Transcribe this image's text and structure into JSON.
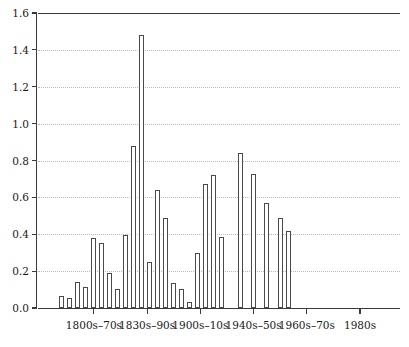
{
  "chart_data": {
    "type": "bar",
    "title": "",
    "subtitle": "",
    "xlabel": "",
    "ylabel": "",
    "ylim": [
      0.0,
      1.6
    ],
    "grid": true,
    "legend": null,
    "y_ticks": [
      0.0,
      0.2,
      0.4,
      0.6,
      0.8,
      1.0,
      1.2,
      1.4,
      1.6
    ],
    "y_tick_labels": [
      "0.0",
      "0.2",
      "0.4",
      "0.6",
      "0.8",
      "1.0",
      "1.2",
      "1.4",
      "1.6"
    ],
    "x_tick_labels": [
      "1800s–70s",
      "1830s–90s",
      "1900s–10s",
      "1940s–50s",
      "1960s–70s",
      "1980s"
    ],
    "x_tick_positions": [
      10.5,
      20.5,
      30.5,
      40.5,
      50.5,
      60.5
    ],
    "bar_count": 34,
    "bar_positions": [
      4.0,
      5.5,
      7.0,
      8.5,
      10.0,
      11.5,
      13.0,
      14.5,
      16.0,
      17.5,
      19.0,
      20.5,
      22.0,
      23.5,
      25.0,
      26.5,
      28.0,
      29.5,
      31.0,
      32.5,
      34.0,
      37.5,
      40.0,
      42.5,
      45.0,
      46.5,
      48.0,
      49.5,
      51.0,
      52.5,
      54.0,
      55.5,
      57.0,
      58.5
    ],
    "values": [
      0.065,
      0.055,
      0.14,
      0.115,
      0.38,
      0.35,
      0.19,
      0.105,
      0.395,
      0.88,
      1.48,
      0.25,
      0.64,
      0.49,
      0.135,
      0.105,
      0.03,
      0.3,
      0.67,
      0.72,
      0.385,
      0.84,
      0.725,
      0.57,
      0.49,
      0.42,
      0.0,
      0.0,
      0.0,
      0.0,
      0.0,
      0.0,
      0.0,
      0.0
    ],
    "bars": [
      {
        "value": 0.065,
        "slot": 0
      },
      {
        "value": 0.055,
        "slot": 1
      },
      {
        "value": 0.14,
        "slot": 2
      },
      {
        "value": 0.115,
        "slot": 3
      },
      {
        "value": 0.38,
        "slot": 4
      },
      {
        "value": 0.35,
        "slot": 5
      },
      {
        "value": 0.19,
        "slot": 6
      },
      {
        "value": 0.105,
        "slot": 7
      },
      {
        "value": 0.395,
        "slot": 8
      },
      {
        "value": 0.88,
        "slot": 9
      },
      {
        "value": 1.48,
        "slot": 10
      },
      {
        "value": 0.25,
        "slot": 11
      },
      {
        "value": 0.64,
        "slot": 12
      },
      {
        "value": 0.49,
        "slot": 13
      },
      {
        "value": 0.135,
        "slot": 14
      },
      {
        "value": 0.105,
        "slot": 15
      },
      {
        "value": 0.03,
        "slot": 16
      },
      {
        "value": 0.3,
        "slot": 17
      },
      {
        "value": 0.67,
        "slot": 18
      },
      {
        "value": 0.72,
        "slot": 19
      },
      {
        "value": 0.385,
        "slot": 20
      },
      {
        "value": 0.84,
        "slot": 21
      },
      {
        "value": 0.725,
        "slot": 22
      },
      {
        "value": 0.57,
        "slot": 23
      },
      {
        "value": 0.49,
        "slot": 24
      },
      {
        "value": 0.42,
        "slot": 25
      }
    ]
  }
}
